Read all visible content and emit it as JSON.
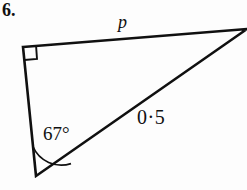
{
  "figure": {
    "question_number": "6.",
    "background_color": "#fdfdfd",
    "stroke_color": "#101010",
    "labels": {
      "top_side": "p",
      "hypotenuse": "0·5",
      "angle": "67°"
    },
    "markers": {
      "right_angle": "right-angle-square",
      "angle_arc": "angle-arc"
    },
    "geometry": {
      "type": "right-triangle",
      "vertices": {
        "top_left": [
          23,
          47
        ],
        "right": [
          247,
          30
        ],
        "bottom": [
          36,
          176
        ]
      },
      "right_angle_at": "top_left",
      "angle_marked_at": "bottom",
      "angle_value_degrees": 67,
      "known_side_label": "0·5",
      "known_side": "hypotenuse",
      "unknown_side_label": "p",
      "unknown_side": "top_left-to-right"
    }
  }
}
